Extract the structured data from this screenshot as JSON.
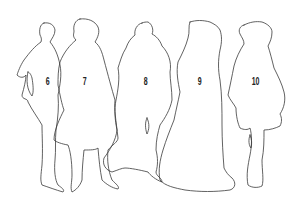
{
  "figures": [
    {
      "label": "6",
      "x": 45,
      "y": 76
    },
    {
      "label": "7",
      "x": 82,
      "y": 76
    },
    {
      "label": "8",
      "x": 143,
      "y": 76
    },
    {
      "label": "9",
      "x": 197,
      "y": 76
    },
    {
      "label": "10",
      "x": 252,
      "y": 76
    }
  ],
  "colors": {
    "stroke": "#3a3a3a",
    "background": "#ffffff"
  }
}
